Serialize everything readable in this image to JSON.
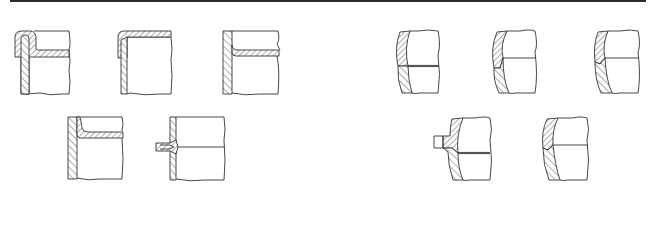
{
  "figure": {
    "colors": {
      "line": "#333333",
      "background": "#ffffff",
      "top_rule": "#2a2a2a"
    },
    "groups": [
      {
        "name": "flat-wall-joints",
        "items": [
          {
            "id": "A",
            "type": "lapped-corner-with-flange",
            "bbox": [
              15,
              30,
              70,
              95
            ]
          },
          {
            "id": "B",
            "type": "top-plate-over-wall",
            "bbox": [
              118,
              30,
              172,
              95
            ]
          },
          {
            "id": "C",
            "type": "flanged-plate-inside-wall",
            "bbox": [
              222,
              30,
              280,
              95
            ]
          },
          {
            "id": "D",
            "type": "flanged-plate-inside-wall-variant",
            "bbox": [
              67,
              116,
              123,
              180
            ]
          },
          {
            "id": "E",
            "type": "tee-stub-through-wall",
            "bbox": [
              155,
              116,
              225,
              180
            ]
          }
        ]
      },
      {
        "name": "curved-wall-joints",
        "items": [
          {
            "id": "F",
            "type": "curved-head-butt-double-line",
            "bbox": [
              393,
              30,
              440,
              93
            ]
          },
          {
            "id": "G",
            "type": "curved-head-butt-single-line",
            "bbox": [
              490,
              30,
              537,
              93
            ]
          },
          {
            "id": "H",
            "type": "curved-head-butt-single-line-variant",
            "bbox": [
              592,
              30,
              640,
              93
            ]
          },
          {
            "id": "I",
            "type": "curved-head-with-stub",
            "bbox": [
              433,
              117,
              490,
              180
            ]
          },
          {
            "id": "J",
            "type": "curved-head-butt-lower",
            "bbox": [
              540,
              117,
              588,
              180
            ]
          }
        ]
      }
    ]
  }
}
